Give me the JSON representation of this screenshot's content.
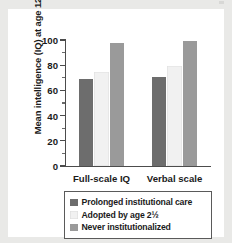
{
  "chart_data": {
    "type": "bar",
    "title": "",
    "xlabel": "",
    "ylabel": "Mean intelligence (IQ) at age 12",
    "categories": [
      "Full-scale IQ",
      "Verbal scale"
    ],
    "series": [
      {
        "name": "Prolonged institutional care",
        "color": "#6d6d6d",
        "values": [
          69,
          71
        ]
      },
      {
        "name": "Adopted by age 2½",
        "color": "#f1f1f1",
        "values": [
          75,
          79
        ]
      },
      {
        "name": "Never institutionalized",
        "color": "#9a9a9a",
        "values": [
          98,
          99
        ]
      }
    ],
    "ylim": [
      0,
      100
    ],
    "yticks": [
      0,
      20,
      40,
      60,
      80,
      100
    ],
    "yticks_minor": [
      10,
      30,
      50,
      70,
      90
    ],
    "grid": false,
    "legend_position": "bottom"
  },
  "legend": {
    "items": [
      {
        "label": "Prolonged institutional care",
        "color": "#6d6d6d"
      },
      {
        "label": "Adopted by age 2½",
        "color": "#f1f1f1"
      },
      {
        "label": "Never institutionalized",
        "color": "#9a9a9a"
      }
    ]
  },
  "colors": {
    "axis": "#4c4c4c",
    "text": "#1b1b1b",
    "panel_background": "#ffffff",
    "page_background": "#e9e9e7",
    "legend_border": "#5a5a5a"
  }
}
